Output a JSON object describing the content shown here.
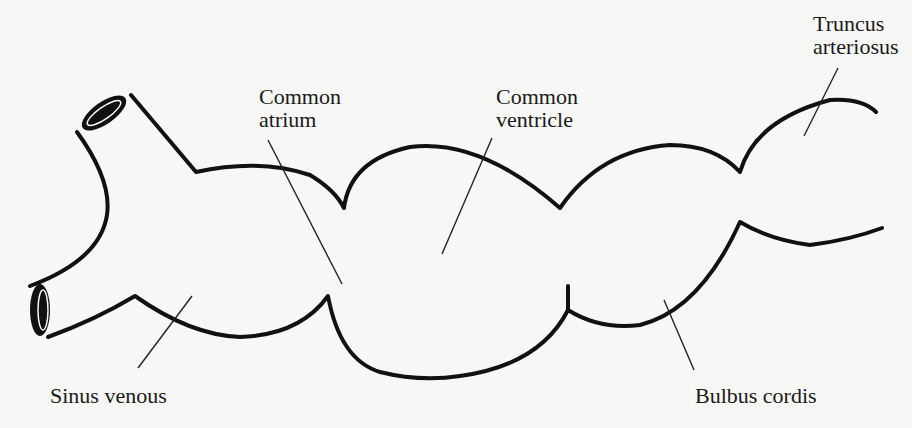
{
  "diagram": {
    "type": "anatomical line drawing — embryonic heart tube",
    "labels": {
      "truncus_arteriosus": {
        "line1": "Truncus",
        "line2": "arteriosus"
      },
      "common_atrium": {
        "line1": "Common",
        "line2": "atrium"
      },
      "common_ventricle": {
        "line1": "Common",
        "line2": "ventricle"
      },
      "sinus_venous": "Sinus venous",
      "bulbus_cordis": "Bulbus cordis"
    },
    "colors": {
      "background": "#f7f7f5",
      "stroke": "#111111",
      "text": "#1a1a1a"
    }
  }
}
